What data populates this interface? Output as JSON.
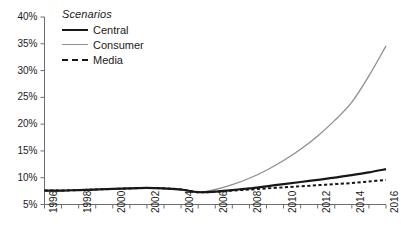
{
  "chart_data": {
    "type": "line",
    "title": "",
    "xlabel": "",
    "ylabel": "",
    "legend_title": "Scenarios",
    "legend_position": "top-left-inside",
    "grid": false,
    "xlim": [
      1996,
      2016
    ],
    "ylim": [
      5,
      40
    ],
    "ytick_format": "percent",
    "ytick_labels": [
      "40%",
      "35%",
      "30%",
      "25%",
      "20%",
      "15%",
      "10%",
      "5%"
    ],
    "ytick_values": [
      40,
      35,
      30,
      25,
      20,
      15,
      10,
      5
    ],
    "xtick_labels": [
      "1996",
      "1998",
      "2000",
      "2002",
      "2004",
      "2006",
      "2008",
      "2010",
      "2012",
      "2014",
      "2016"
    ],
    "xtick_values": [
      1996,
      1998,
      2000,
      2002,
      2004,
      2006,
      2008,
      2010,
      2012,
      2014,
      2016
    ],
    "x_minor_tick_step": 1,
    "x": [
      1996,
      1997,
      1998,
      1999,
      2000,
      2001,
      2002,
      2003,
      2004,
      2005,
      2006,
      2007,
      2008,
      2009,
      2010,
      2011,
      2012,
      2013,
      2014,
      2015,
      2016
    ],
    "series": [
      {
        "name": "Central",
        "color": "#171717",
        "style": "solid",
        "width": 2.2,
        "values": [
          7.6,
          7.6,
          7.7,
          7.8,
          7.9,
          8.0,
          8.1,
          8.0,
          7.8,
          7.3,
          7.4,
          7.7,
          8.0,
          8.4,
          8.8,
          9.2,
          9.6,
          10.0,
          10.5,
          11.0,
          11.6
        ]
      },
      {
        "name": "Consumer",
        "color": "#8e8e8e",
        "style": "solid",
        "width": 1.3,
        "values": [
          7.6,
          7.6,
          7.7,
          7.8,
          7.9,
          8.0,
          8.1,
          8.0,
          7.8,
          7.3,
          7.8,
          8.7,
          9.9,
          11.4,
          13.2,
          15.3,
          17.8,
          20.7,
          24.1,
          29.0,
          34.6
        ]
      },
      {
        "name": "Media",
        "color": "#171717",
        "style": "dashed",
        "width": 2.0,
        "values": [
          7.6,
          7.6,
          7.7,
          7.8,
          7.9,
          8.0,
          8.1,
          8.0,
          7.8,
          7.3,
          7.4,
          7.6,
          7.8,
          8.0,
          8.2,
          8.4,
          8.6,
          8.8,
          9.0,
          9.3,
          9.6
        ]
      }
    ]
  },
  "legend": {
    "title": "Scenarios",
    "entries": [
      {
        "label": "Central"
      },
      {
        "label": "Consumer"
      },
      {
        "label": "Media"
      }
    ]
  },
  "axes": {
    "y_labels": [
      "40%",
      "35%",
      "30%",
      "25%",
      "20%",
      "15%",
      "10%",
      "5%"
    ],
    "x_labels": [
      "1996",
      "1998",
      "2000",
      "2002",
      "2004",
      "2006",
      "2008",
      "2010",
      "2012",
      "2014",
      "2016"
    ]
  },
  "colors": {
    "central": "#171717",
    "consumer": "#8e8e8e",
    "media": "#171717",
    "axis": "#6d6d6d",
    "background": "#ffffff"
  }
}
